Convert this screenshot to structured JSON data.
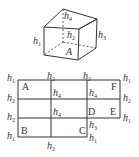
{
  "figure": {
    "cube": {
      "labels": {
        "h1": {
          "base": "h",
          "sub": "1"
        },
        "h2": {
          "base": "h",
          "sub": "2"
        },
        "h3": {
          "base": "h",
          "sub": "3"
        },
        "h4": {
          "base": "h",
          "sub": "4"
        },
        "A": "A"
      }
    },
    "net": {
      "points": {
        "A": "A",
        "B": "B",
        "C": "C",
        "D": "D",
        "E": "E",
        "F": "F"
      },
      "edge_labels": [
        {
          "base": "h",
          "sub": "1"
        },
        {
          "base": "h",
          "sub": "2"
        },
        {
          "base": "h",
          "sub": "2"
        },
        {
          "base": "h",
          "sub": "1"
        },
        {
          "base": "h",
          "sub": "2"
        },
        {
          "base": "h",
          "sub": "4"
        },
        {
          "base": "h",
          "sub": "4"
        },
        {
          "base": "h",
          "sub": "2"
        },
        {
          "base": "h",
          "sub": "2"
        },
        {
          "base": "h",
          "sub": "4"
        },
        {
          "base": "h",
          "sub": "1"
        },
        {
          "base": "h",
          "sub": "3"
        },
        {
          "base": "h",
          "sub": "1"
        },
        {
          "base": "h",
          "sub": "1"
        },
        {
          "base": "h",
          "sub": "2"
        }
      ]
    }
  }
}
